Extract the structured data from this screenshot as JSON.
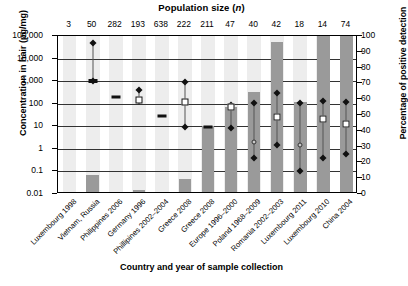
{
  "chart_data": {
    "type": "bar",
    "title": "Population size (n)",
    "top_axis_label": "Population size (n)",
    "xlabel": "Country and year of sample collection",
    "ylabel": "Concentration in hair (pg/mg)",
    "ylabel_right": "Percentage of positive detection",
    "ylim": [
      0.01,
      100000
    ],
    "ylim_right": [
      0,
      100
    ],
    "yscale": "log",
    "grid": true,
    "legend": "none",
    "categories": [
      "Luxembourg 1998",
      "Vietnam, Russia",
      "Philippines 2006",
      "Germany 1996",
      "Phillipines 2002–2004",
      "Greece 2008",
      "Greece 2008",
      "Europe 1996–2000",
      "Poland  1968–2009",
      "Romania 2002–2003",
      "Luxembourg 2011",
      "Luxembourg 2010",
      "China 2004"
    ],
    "population_sizes": [
      3,
      50,
      282,
      193,
      638,
      222,
      211,
      47,
      40,
      42,
      18,
      14,
      74
    ],
    "ytick_labels_left": [
      "100,000",
      "10,000",
      "1,000",
      "100",
      "10",
      "1",
      "0.1",
      "0.01"
    ],
    "ytick_values_left": [
      100000,
      10000,
      1000,
      100,
      10,
      1,
      0.1,
      0.01
    ],
    "ytick_labels_right": [
      "100",
      "90",
      "80",
      "70",
      "60",
      "50",
      "40",
      "30",
      "20",
      "10",
      "0"
    ],
    "ytick_values_right": [
      100,
      90,
      80,
      70,
      60,
      50,
      40,
      30,
      20,
      10,
      0
    ],
    "series": [
      {
        "name": "Percentage of positive detection",
        "type": "bar",
        "values": [
          0,
          11,
          0,
          1,
          0,
          8,
          42,
          54,
          63,
          95,
          57,
          100,
          100
        ]
      },
      {
        "name": "Concentration markers (pg/mg)",
        "type": "box-whisker",
        "points": [
          {
            "category": "Luxembourg 1998",
            "markers": []
          },
          {
            "category": "Vietnam, Russia",
            "max": 50000,
            "median": 1000,
            "min": 1000
          },
          {
            "category": "Philippines 2006",
            "median": 200
          },
          {
            "category": "Germany 1996",
            "max": 400,
            "median": 150,
            "min": 130
          },
          {
            "category": "Phillipines 2002–2004",
            "median": 30
          },
          {
            "category": "Greece 2008",
            "max": 900,
            "median": 120,
            "min": 9
          },
          {
            "category": "Greece 2008",
            "median": 9
          },
          {
            "category": "Europe 1996–2000",
            "max": 90,
            "median": 70,
            "min": 8
          },
          {
            "category": "Poland  1968–2009",
            "max": 110,
            "median": 2,
            "min": 0.4
          },
          {
            "category": "Romania 2002–2003",
            "max": 300,
            "median": 25,
            "min": 1.5
          },
          {
            "category": "Luxembourg 2011",
            "max": 110,
            "median": 1.5,
            "min": 0.1
          },
          {
            "category": "Luxembourg 2010",
            "max": 130,
            "median": 20,
            "min": 0.4
          },
          {
            "category": "China 2004",
            "max": 120,
            "median": 12,
            "min": 0.6
          }
        ]
      }
    ],
    "colors": {
      "bar_dark": "#9a9a9a",
      "bar_light": "#d6d6d6",
      "stripe": "#ededed",
      "marker": "#111111",
      "grid": "#333333"
    }
  }
}
